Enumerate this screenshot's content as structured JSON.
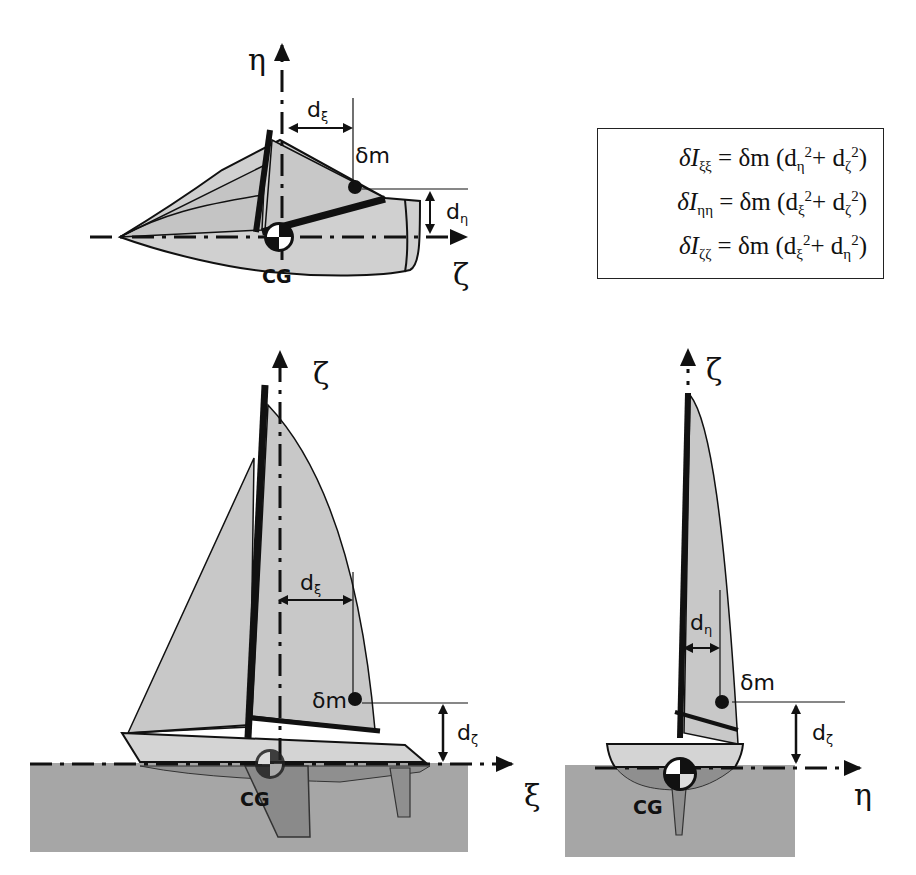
{
  "figure": {
    "type": "diagram"
  },
  "formulas": [
    {
      "lhs": "δI",
      "lhs_sub": "ξξ",
      "eq": "=",
      "rhs_prefix": "δm (",
      "term1": "d",
      "term1_sub": "η",
      "term1_sup": "2",
      "plus": "+ ",
      "term2": "d",
      "term2_sub": "ζ",
      "term2_sup": "2",
      "close": ")"
    },
    {
      "lhs": "δI",
      "lhs_sub": "ηη",
      "eq": "=",
      "rhs_prefix": "δm (",
      "term1": "d",
      "term1_sub": "ξ",
      "term1_sup": "2",
      "plus": "+ ",
      "term2": "d",
      "term2_sub": "ζ",
      "term2_sup": "2",
      "close": ")"
    },
    {
      "lhs": "δI",
      "lhs_sub": "ζζ",
      "eq": "=",
      "rhs_prefix": "δm (",
      "term1": "d",
      "term1_sub": "ξ",
      "term1_sup": "2",
      "plus": "+ ",
      "term2": "d",
      "term2_sub": "η",
      "term2_sup": "2",
      "close": ")"
    }
  ],
  "top_view": {
    "axis_vertical": "η",
    "axis_horizontal": "ζ",
    "dist_h": {
      "d": "d",
      "sub": "ξ"
    },
    "dist_v": {
      "d": "d",
      "sub": "η"
    },
    "mass_label": "δm",
    "cg_label": "CG"
  },
  "side_view": {
    "axis_vertical": "ζ",
    "axis_horizontal": "ξ",
    "dist_h": {
      "d": "d",
      "sub": "ξ"
    },
    "dist_v": {
      "d": "d",
      "sub": "ζ"
    },
    "mass_label": "δm",
    "cg_label": "CG"
  },
  "front_view": {
    "axis_vertical": "ζ",
    "axis_horizontal": "η",
    "dist_h": {
      "d": "d",
      "sub": "η"
    },
    "dist_v": {
      "d": "d",
      "sub": "ζ"
    },
    "mass_label": "δm",
    "cg_label": "CG"
  },
  "colors": {
    "sail": "#c8c8c8",
    "hull": "#d4d4d4",
    "water": "#a6a6a6",
    "underwater_hull": "#8f8f8f",
    "ink": "#111111"
  }
}
